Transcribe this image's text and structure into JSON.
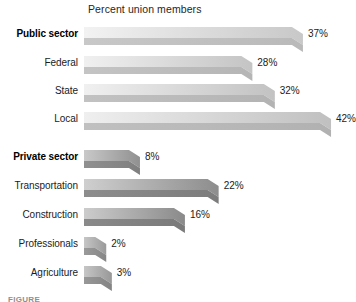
{
  "chart_data": {
    "type": "bar",
    "orientation": "horizontal",
    "title": "Percent union members",
    "xlabel": "",
    "ylabel": "",
    "grid": false,
    "legend": null,
    "xlim": [
      0,
      45
    ],
    "value_suffix": "%",
    "categories": [
      "Public sector",
      "Federal",
      "State",
      "Local",
      "Private sector",
      "Transportation",
      "Construction",
      "Professionals",
      "Agriculture"
    ],
    "values": [
      37,
      28,
      32,
      42,
      8,
      22,
      16,
      2,
      3
    ],
    "value_labels": [
      "37%",
      "28%",
      "32%",
      "42%",
      "8%",
      "22%",
      "16%",
      "2%",
      "3%"
    ],
    "bars": [
      {
        "label": "Public sector",
        "value": 37,
        "value_label": "37%",
        "bold": true,
        "group": "public",
        "fill_light": "#f2f2f2",
        "fill_dark": "#c8c8c8",
        "front": "#b9b9b9"
      },
      {
        "label": "Federal",
        "value": 28,
        "value_label": "28%",
        "bold": false,
        "group": "public",
        "fill_light": "#f0f0f0",
        "fill_dark": "#c4c4c4",
        "front": "#b5b5b5"
      },
      {
        "label": "State",
        "value": 32,
        "value_label": "32%",
        "bold": false,
        "group": "public",
        "fill_light": "#f0f0f0",
        "fill_dark": "#c2c2c2",
        "front": "#b3b3b3"
      },
      {
        "label": "Local",
        "value": 42,
        "value_label": "42%",
        "bold": false,
        "group": "public",
        "fill_light": "#efefef",
        "fill_dark": "#c0c0c0",
        "front": "#b1b1b1"
      },
      {
        "label": "Private sector",
        "value": 8,
        "value_label": "8%",
        "bold": true,
        "group": "private",
        "fill_light": "#c9c9c9",
        "fill_dark": "#909090",
        "front": "#7f7f7f"
      },
      {
        "label": "Transportation",
        "value": 22,
        "value_label": "22%",
        "bold": false,
        "group": "private",
        "fill_light": "#cfcfcf",
        "fill_dark": "#8d8d8d",
        "front": "#7c7c7c"
      },
      {
        "label": "Construction",
        "value": 16,
        "value_label": "16%",
        "bold": false,
        "group": "private",
        "fill_light": "#cccccc",
        "fill_dark": "#8a8a8a",
        "front": "#7a7a7a"
      },
      {
        "label": "Professionals",
        "value": 2,
        "value_label": "2%",
        "bold": false,
        "group": "private",
        "fill_light": "#c6c6c6",
        "fill_dark": "#9a9a9a",
        "front": "#868686"
      },
      {
        "label": "Agriculture",
        "value": 3,
        "value_label": "3%",
        "bold": false,
        "group": "private",
        "fill_light": "#c6c6c6",
        "fill_dark": "#989898",
        "front": "#848484"
      }
    ],
    "colors": {
      "background": "#ffffff",
      "text": "#1b1b1b",
      "public_sector_bar": "#d9d9d9",
      "private_sector_bar": "#9a9a9a"
    }
  },
  "figure": {
    "caption": "FIGURE"
  }
}
